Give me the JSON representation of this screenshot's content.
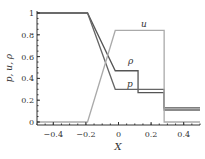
{
  "chart_data": {
    "type": "line",
    "title": "",
    "xlabel": "X",
    "ylabel": "p, u, ρ",
    "xlim": [
      -0.5,
      0.5
    ],
    "ylim": [
      0,
      1
    ],
    "xticks": [
      "−0.4",
      "−0.2",
      "0",
      "0.2",
      "0.4"
    ],
    "yticks": [
      "0",
      "0.2",
      "0.4",
      "0.6",
      "0.8",
      "1"
    ],
    "grid": false,
    "legend": "inline labels",
    "series": [
      {
        "name": "ρ",
        "label": "ρ",
        "color": "#555555",
        "x": [
          -0.5,
          -0.19,
          -0.02,
          0.12,
          0.12,
          0.28,
          0.28,
          0.5
        ],
        "y": [
          1.0,
          1.0,
          0.47,
          0.47,
          0.27,
          0.27,
          0.13,
          0.13
        ]
      },
      {
        "name": "p",
        "label": "p",
        "color": "#666666",
        "x": [
          -0.5,
          -0.19,
          -0.02,
          0.28,
          0.28,
          0.5
        ],
        "y": [
          1.0,
          1.0,
          0.3,
          0.3,
          0.11,
          0.11
        ]
      },
      {
        "name": "u",
        "label": "u",
        "color": "#aaaaaa",
        "x": [
          -0.5,
          -0.19,
          -0.02,
          0.28,
          0.28,
          0.5
        ],
        "y": [
          0.0,
          0.0,
          0.84,
          0.84,
          0.0,
          0.0
        ]
      }
    ]
  },
  "labels": {
    "x": "X",
    "y": "p, u, ρ",
    "u": "u",
    "rho": "ρ",
    "p": "p"
  }
}
